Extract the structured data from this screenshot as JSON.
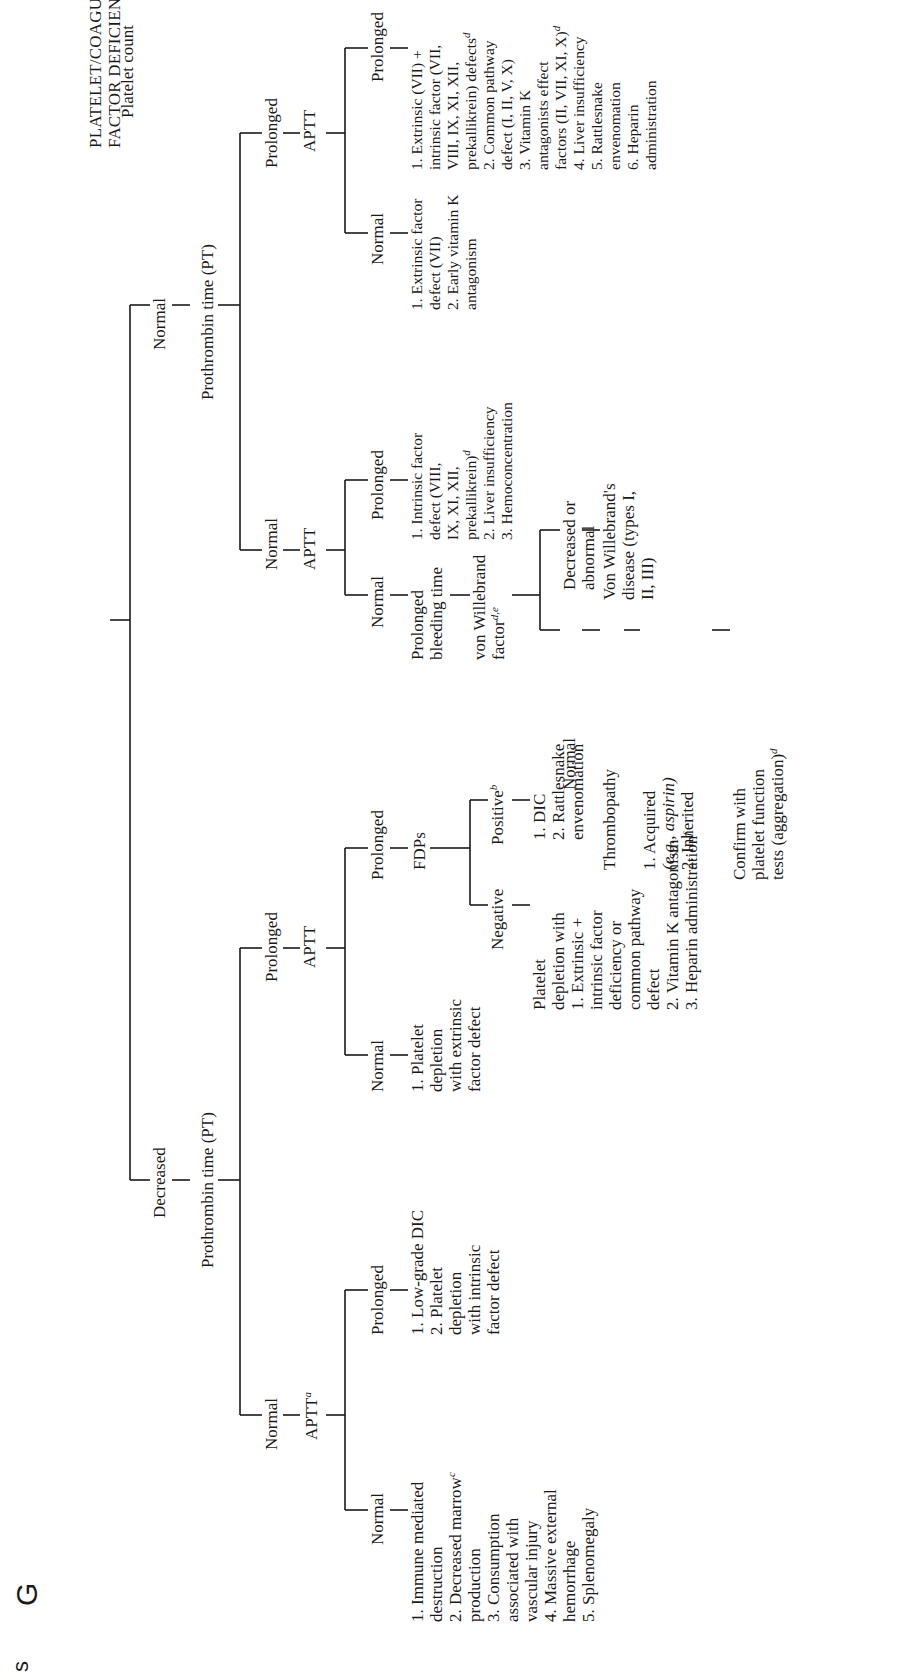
{
  "title": {
    "line1": "PLATELET/COAGULATION",
    "line2": "FACTOR DEFICIENCIES"
  },
  "root": "Platelet count",
  "page_edge_marks": [
    "G",
    "s"
  ],
  "footnote_markers": [
    "a",
    "b",
    "c",
    "d",
    "e",
    "f"
  ],
  "tree": {
    "decreased": {
      "label": "Decreased",
      "test": "Prothrombin time (PT)",
      "pt_normal": {
        "label": "Normal",
        "test": "APTT",
        "test_sup": "a",
        "aptt_normal": {
          "label": "Normal",
          "causes": [
            "1. Immune mediated",
            "destruction",
            "2. Decreased marrow",
            "production",
            "3. Consumption",
            "associated with",
            "vascular injury",
            "4. Massive external",
            "hemorrhage",
            "5. Splenomegaly"
          ],
          "production_sup": "c"
        },
        "aptt_prolonged": {
          "label": "Prolonged",
          "causes": [
            "1. Low-grade DIC",
            "2. Platelet",
            "depletion",
            "with intrinsic",
            "factor defect"
          ]
        }
      },
      "pt_prolonged": {
        "label": "Prolonged",
        "test": "APTT",
        "aptt_normal": {
          "label": "Normal",
          "causes": [
            "1. Platelet",
            "depletion",
            "with extrinsic",
            "factor defect"
          ]
        },
        "aptt_prolonged": {
          "label": "Prolonged",
          "test": "FDPs",
          "fdp_negative": {
            "label": "Negative",
            "causes": [
              "Platelet",
              "depletion with",
              "1. Extrinsic +",
              "intrinsic factor",
              "deficiency or",
              "common pathway",
              "defect",
              "2. Vitamin K antagonism",
              "3. Heparin administration"
            ],
            "heparin_sup": "f"
          },
          "fdp_positive": {
            "label": "Positive",
            "label_sup": "b",
            "causes": [
              "1. DIC",
              "2. Rattlesnake",
              "envenomation"
            ]
          }
        }
      }
    },
    "normal": {
      "label": "Normal",
      "test": "Prothrombin time (PT)",
      "pt_normal": {
        "label": "Normal",
        "test": "APTT",
        "aptt_normal": {
          "label": "Normal",
          "next": [
            "Prolonged",
            "bleeding time"
          ],
          "vwf": {
            "label_l1": "von Willebrand",
            "label_l2": "factor",
            "sup": "d,e"
          },
          "vwf_normal": {
            "label": "Normal",
            "result": "Thrombopathy",
            "causes": [
              "1. Acquired",
              "(e.g., aspirin)",
              "2. Inherited"
            ],
            "confirm": [
              "Confirm with",
              "platelet function",
              "tests (aggregation)"
            ],
            "confirm_sup": "d"
          },
          "vwf_decreased": {
            "label_l1": "Decreased or",
            "label_l2": "abnormal",
            "causes": [
              "Von Willebrand's",
              "disease (types I,",
              "II, III)"
            ]
          }
        },
        "aptt_prolonged": {
          "label": "Prolonged",
          "causes": [
            "1. Intrinsic factor",
            "defect (VIII,",
            "IX, XI, XII,",
            "prekallikrein)",
            "2. Liver insufficiency",
            "3. Hemoconcentration"
          ],
          "prekallikrein_sup": "d"
        }
      },
      "pt_prolonged": {
        "label": "Prolonged",
        "test": "APTT",
        "aptt_normal": {
          "label": "Normal",
          "causes": [
            "1. Extrinsic factor",
            "defect (VII)",
            "2. Early vitamin K",
            "antagonism"
          ]
        },
        "aptt_prolonged": {
          "label": "Prolonged",
          "causes": [
            "1. Extrinsic (VII) +",
            "intrinsic factor (VII,",
            "VIII, IX, XI, XII,",
            "prekallikrein) defects",
            "2. Common pathway",
            "defect (I, II, V, X)",
            "3. Vitamin K",
            "antagonists effect",
            "factors (II, VII, XI, X)",
            "4. Liver insufficiency",
            "5. Rattlesnake",
            "envenomation",
            "6. Heparin",
            "administration"
          ],
          "defects_sup": "d",
          "factors_sup": "d"
        }
      }
    }
  }
}
